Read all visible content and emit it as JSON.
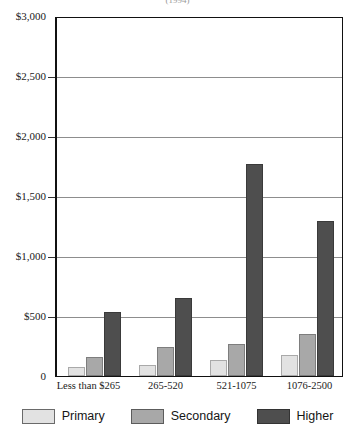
{
  "title_partial": "(1994)",
  "chart_data": {
    "type": "bar",
    "title": "",
    "xlabel": "",
    "ylabel": "",
    "ylim": [
      0,
      3000
    ],
    "ytick_labels": [
      "$3,000",
      "$2,500",
      "$2,000",
      "$1,500",
      "$1,000",
      "$500",
      "0"
    ],
    "ytick_values": [
      3000,
      2500,
      2000,
      1500,
      1000,
      500,
      0
    ],
    "grid": true,
    "legend_position": "bottom",
    "categories": [
      "Less than $265",
      "265-520",
      "521-1075",
      "1076-2500"
    ],
    "series": [
      {
        "name": "Primary",
        "color": "#e2e2e2",
        "values": [
          75,
          90,
          135,
          175
        ]
      },
      {
        "name": "Secondary",
        "color": "#a8a8a8",
        "values": [
          160,
          240,
          270,
          355
        ]
      },
      {
        "name": "Higher",
        "color": "#4e4e4e",
        "values": [
          540,
          650,
          1780,
          1300
        ]
      }
    ]
  },
  "legend": {
    "items": [
      {
        "label": "Primary"
      },
      {
        "label": "Secondary"
      },
      {
        "label": "Higher"
      }
    ]
  }
}
